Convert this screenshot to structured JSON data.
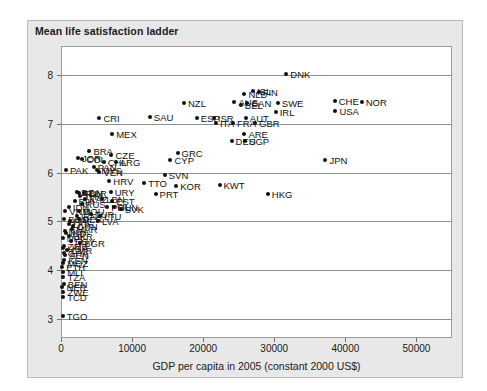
{
  "chart_data": {
    "type": "scatter",
    "title": "Mean life satisfaction ladder",
    "xlabel": "GDP per capita in 2005 (constant 2000 US$)",
    "ylabel": "",
    "xlim": [
      0,
      55000
    ],
    "ylim": [
      2.6,
      8.6
    ],
    "xticks": [
      0,
      10000,
      20000,
      30000,
      40000,
      50000
    ],
    "xtick_labels": [
      "0",
      "10000",
      "20000",
      "30000",
      "40000",
      "50000"
    ],
    "yticks": [
      3,
      4,
      5,
      6,
      7,
      8
    ],
    "ytick_labels": [
      "3",
      "4",
      "5",
      "6",
      "7",
      "8"
    ],
    "grid": "horizontal",
    "legend": "none",
    "marker_color": "#111111",
    "point_label_field": "iso3",
    "points": [
      {
        "iso3": "DNK",
        "x": 31700,
        "y": 8.02
      },
      {
        "iso3": "NOR",
        "x": 42300,
        "y": 7.45
      },
      {
        "iso3": "CHE",
        "x": 38500,
        "y": 7.48
      },
      {
        "iso3": "USA",
        "x": 38600,
        "y": 7.27
      },
      {
        "iso3": "SWE",
        "x": 30500,
        "y": 7.42
      },
      {
        "iso3": "IRL",
        "x": 30200,
        "y": 7.25
      },
      {
        "iso3": "FIN",
        "x": 27800,
        "y": 7.65
      },
      {
        "iso3": "ISL",
        "x": 27000,
        "y": 7.67
      },
      {
        "iso3": "NLD",
        "x": 25800,
        "y": 7.62
      },
      {
        "iso3": "AUS",
        "x": 24400,
        "y": 7.45
      },
      {
        "iso3": "BEL",
        "x": 25300,
        "y": 7.38
      },
      {
        "iso3": "CAN",
        "x": 26200,
        "y": 7.42
      },
      {
        "iso3": "AUT",
        "x": 26000,
        "y": 7.12
      },
      {
        "iso3": "GBR",
        "x": 27300,
        "y": 7.02
      },
      {
        "iso3": "FRA",
        "x": 24200,
        "y": 7.01
      },
      {
        "iso3": "NZL",
        "x": 17300,
        "y": 7.43
      },
      {
        "iso3": "ESP",
        "x": 19100,
        "y": 7.12
      },
      {
        "iso3": "ISR",
        "x": 21500,
        "y": 7.13
      },
      {
        "iso3": "ITA",
        "x": 21800,
        "y": 7.01
      },
      {
        "iso3": "SAU",
        "x": 12500,
        "y": 7.15
      },
      {
        "iso3": "CRI",
        "x": 5400,
        "y": 7.12
      },
      {
        "iso3": "ARE",
        "x": 25800,
        "y": 6.8
      },
      {
        "iso3": "DEU",
        "x": 24000,
        "y": 6.65
      },
      {
        "iso3": "SGP",
        "x": 25900,
        "y": 6.65
      },
      {
        "iso3": "JPN",
        "x": 37200,
        "y": 6.25
      },
      {
        "iso3": "MEX",
        "x": 7200,
        "y": 6.8
      },
      {
        "iso3": "GRC",
        "x": 16400,
        "y": 6.4
      },
      {
        "iso3": "CYP",
        "x": 15400,
        "y": 6.25
      },
      {
        "iso3": "BRA",
        "x": 4000,
        "y": 6.45
      },
      {
        "iso3": "CZE",
        "x": 7100,
        "y": 6.37
      },
      {
        "iso3": "ARG",
        "x": 7700,
        "y": 6.22
      },
      {
        "iso3": "COL",
        "x": 3000,
        "y": 6.27
      },
      {
        "iso3": "JOR",
        "x": 2400,
        "y": 6.3
      },
      {
        "iso3": "CHL",
        "x": 6000,
        "y": 6.22
      },
      {
        "iso3": "PAN",
        "x": 4600,
        "y": 6.12
      },
      {
        "iso3": "MYS",
        "x": 5100,
        "y": 6.05
      },
      {
        "iso3": "VEN",
        "x": 5400,
        "y": 6.02
      },
      {
        "iso3": "PAK",
        "x": 700,
        "y": 6.05
      },
      {
        "iso3": "SVN",
        "x": 14600,
        "y": 5.95
      },
      {
        "iso3": "KWT",
        "x": 22300,
        "y": 5.75
      },
      {
        "iso3": "HKG",
        "x": 29100,
        "y": 5.55
      },
      {
        "iso3": "KOR",
        "x": 16200,
        "y": 5.72
      },
      {
        "iso3": "TTO",
        "x": 11700,
        "y": 5.78
      },
      {
        "iso3": "PRT",
        "x": 13300,
        "y": 5.55
      },
      {
        "iso3": "HRV",
        "x": 6800,
        "y": 5.82
      },
      {
        "iso3": "URY",
        "x": 7000,
        "y": 5.6
      },
      {
        "iso3": "BLR",
        "x": 3300,
        "y": 5.58
      },
      {
        "iso3": "EST",
        "x": 7200,
        "y": 5.42
      },
      {
        "iso3": "LBN",
        "x": 5800,
        "y": 5.46
      },
      {
        "iso3": "KAZ",
        "x": 3400,
        "y": 5.45
      },
      {
        "iso3": "HUN",
        "x": 7400,
        "y": 5.3
      },
      {
        "iso3": "SVK",
        "x": 8400,
        "y": 5.25
      },
      {
        "iso3": "POL",
        "x": 6500,
        "y": 5.3
      },
      {
        "iso3": "THA",
        "x": 2700,
        "y": 5.52
      },
      {
        "iso3": "DZA",
        "x": 2300,
        "y": 5.6
      },
      {
        "iso3": "TUN",
        "x": 2600,
        "y": 5.58
      },
      {
        "iso3": "BIH",
        "x": 1900,
        "y": 5.42
      },
      {
        "iso3": "RUS",
        "x": 2900,
        "y": 5.35
      },
      {
        "iso3": "IDN",
        "x": 1100,
        "y": 5.3
      },
      {
        "iso3": "ROU",
        "x": 2600,
        "y": 5.2
      },
      {
        "iso3": "LVA",
        "x": 5200,
        "y": 5.0
      },
      {
        "iso3": "LTU",
        "x": 5500,
        "y": 5.1
      },
      {
        "iso3": "TUR",
        "x": 4200,
        "y": 5.15
      },
      {
        "iso3": "IRN",
        "x": 2200,
        "y": 5.1
      },
      {
        "iso3": "PER",
        "x": 2500,
        "y": 5.05
      },
      {
        "iso3": "PHL",
        "x": 1200,
        "y": 5.0
      },
      {
        "iso3": "CHN",
        "x": 1700,
        "y": 4.9
      },
      {
        "iso3": "MAR",
        "x": 1600,
        "y": 4.85
      },
      {
        "iso3": "BGR",
        "x": 2700,
        "y": 4.55
      },
      {
        "iso3": "UKR",
        "x": 1100,
        "y": 4.7
      },
      {
        "iso3": "EGY",
        "x": 1400,
        "y": 4.6
      },
      {
        "iso3": "IND",
        "x": 700,
        "y": 4.75
      },
      {
        "iso3": "VNM",
        "x": 600,
        "y": 5.2
      },
      {
        "iso3": "NGA",
        "x": 500,
        "y": 4.8
      },
      {
        "iso3": "KEN",
        "x": 450,
        "y": 4.2
      },
      {
        "iso3": "GHA",
        "x": 400,
        "y": 4.35
      },
      {
        "iso3": "UGA",
        "x": 350,
        "y": 4.45
      },
      {
        "iso3": "ETH",
        "x": 160,
        "y": 4.05
      },
      {
        "iso3": "MLI",
        "x": 300,
        "y": 3.95
      },
      {
        "iso3": "BEN",
        "x": 400,
        "y": 3.7
      },
      {
        "iso3": "TCD",
        "x": 300,
        "y": 3.45
      },
      {
        "iso3": "NER",
        "x": 200,
        "y": 3.65
      },
      {
        "iso3": "ZWE",
        "x": 350,
        "y": 3.55
      },
      {
        "iso3": "TZA",
        "x": 350,
        "y": 3.85
      },
      {
        "iso3": "MOZ",
        "x": 300,
        "y": 4.15
      },
      {
        "iso3": "SEN",
        "x": 600,
        "y": 4.3
      },
      {
        "iso3": "CMR",
        "x": 800,
        "y": 4.4
      },
      {
        "iso3": "ZMB",
        "x": 400,
        "y": 4.5
      },
      {
        "iso3": "BGD",
        "x": 450,
        "y": 5.05
      },
      {
        "iso3": "LKA",
        "x": 1100,
        "y": 4.95
      },
      {
        "iso3": "NPL",
        "x": 250,
        "y": 4.65
      },
      {
        "iso3": "TGO",
        "x": 250,
        "y": 3.05
      }
    ]
  }
}
